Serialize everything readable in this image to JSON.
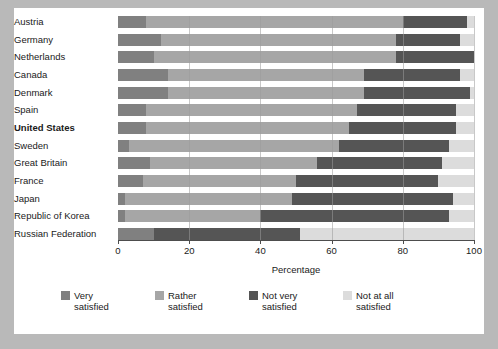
{
  "chart_data": {
    "type": "bar",
    "orientation": "horizontal",
    "stacked": true,
    "stack_mode": "percent",
    "title": "",
    "xlabel": "Percentage",
    "ylabel": "",
    "xlim": [
      0,
      100
    ],
    "xticks": [
      0,
      20,
      40,
      60,
      80,
      100
    ],
    "xticklabels": [
      "0",
      "20",
      "40",
      "60",
      "80",
      "100"
    ],
    "grid": "vertical",
    "legend_position": "bottom",
    "highlight_category": "United States",
    "categories": [
      "Austria",
      "Germany",
      "Netherlands",
      "Canada",
      "Denmark",
      "Spain",
      "United States",
      "Sweden",
      "Great Britain",
      "France",
      "Japan",
      "Republic of Korea",
      "Russian Federation"
    ],
    "series": [
      {
        "name": "Very satisfied",
        "color": "#808080",
        "values": [
          8,
          12,
          10,
          14,
          14,
          8,
          8,
          3,
          9,
          7,
          2,
          2,
          10
        ]
      },
      {
        "name": "Rather satisfied",
        "color": "#a6a6a6",
        "values": [
          72,
          66,
          68,
          55,
          55,
          59,
          57,
          59,
          47,
          43,
          47,
          38,
          0
        ]
      },
      {
        "name": "Not very satisfied",
        "color": "#555555",
        "values": [
          18,
          18,
          22,
          27,
          30,
          28,
          30,
          31,
          35,
          40,
          45,
          53,
          41
        ]
      },
      {
        "name": "Not at all satisfied",
        "color": "#dcdcdc",
        "values": [
          2,
          4,
          0,
          4,
          1,
          5,
          5,
          7,
          9,
          10,
          6,
          7,
          49
        ]
      }
    ]
  },
  "legend": {
    "items": [
      {
        "label_line1": "Very",
        "label_line2": "satisfied",
        "color": "#808080"
      },
      {
        "label_line1": "Rather",
        "label_line2": "satisfied",
        "color": "#a6a6a6"
      },
      {
        "label_line1": "Not very",
        "label_line2": "satisfied",
        "color": "#555555"
      },
      {
        "label_line1": "Not at all",
        "label_line2": "satisfied",
        "color": "#dcdcdc"
      }
    ]
  }
}
